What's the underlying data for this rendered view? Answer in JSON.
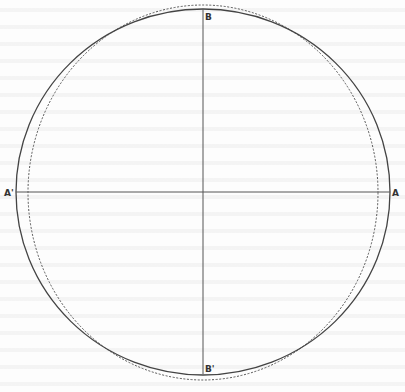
{
  "figure": {
    "labels": {
      "top": "B",
      "bottom": "B'",
      "left": "A'",
      "right": "A"
    },
    "center": [
      203,
      192
    ],
    "solid_circle": {
      "cx": 203,
      "cy": 192,
      "rx": 187,
      "ry": 183
    },
    "dotted_ellipse": {
      "cx": 203,
      "cy": 192.5,
      "rx": 175,
      "ry": 187.5
    },
    "horizontal_axis": {
      "x1": 16,
      "y1": 192,
      "x2": 390,
      "y2": 192
    },
    "vertical_axis": {
      "x1": 203,
      "y1": 9,
      "x2": 203,
      "y2": 374
    },
    "colors": {
      "line": "#444444",
      "dotted": "#555555",
      "label": "#333333"
    }
  }
}
